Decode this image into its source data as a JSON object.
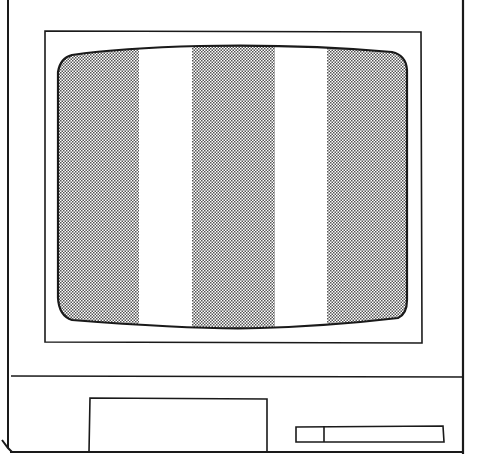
{
  "illustration": {
    "subject": "monitor with test pattern",
    "colors": {
      "ink": "#1a1a1a",
      "paper": "#ffffff",
      "stipple_dot": "#555555"
    },
    "screen": {
      "bars": [
        {
          "fill": "stipple",
          "x0": 57,
          "x1": 139
        },
        {
          "fill": "white",
          "x0": 139,
          "x1": 192
        },
        {
          "fill": "stipple",
          "x0": 192,
          "x1": 275
        },
        {
          "fill": "white",
          "x0": 275,
          "x1": 327
        },
        {
          "fill": "stipple",
          "x0": 327,
          "x1": 407
        }
      ]
    },
    "controls": {
      "panel": "front-panel-rectangle",
      "slot": "drive-slot"
    }
  }
}
